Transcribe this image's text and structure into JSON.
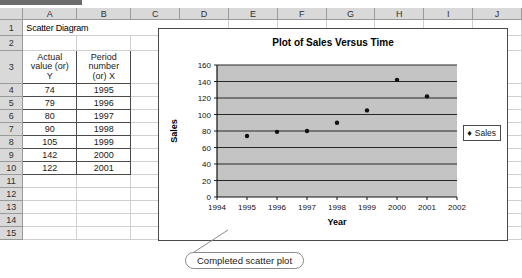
{
  "spreadsheet": {
    "column_headers": [
      "A",
      "B",
      "C",
      "D",
      "E",
      "F",
      "G",
      "H",
      "I",
      "J"
    ],
    "row_headers": [
      "1",
      "2",
      "3",
      "4",
      "5",
      "6",
      "7",
      "8",
      "9",
      "10",
      "11",
      "12",
      "13",
      "14",
      "15"
    ],
    "sheet_title": "Scatter Diagram",
    "table_headers": {
      "col_a": "Actual value (or) Y",
      "col_a_line1": "Actual",
      "col_a_line2": "value (or)",
      "col_a_line3": "Y",
      "col_b": "Period number (or) X",
      "col_b_line1": "Period",
      "col_b_line2": "number",
      "col_b_line3": "(or) X"
    },
    "rows": [
      {
        "row": "4",
        "a": "74",
        "b": "1995"
      },
      {
        "row": "5",
        "a": "79",
        "b": "1996"
      },
      {
        "row": "6",
        "a": "80",
        "b": "1997"
      },
      {
        "row": "7",
        "a": "90",
        "b": "1998"
      },
      {
        "row": "8",
        "a": "105",
        "b": "1999"
      },
      {
        "row": "9",
        "a": "142",
        "b": "2000"
      },
      {
        "row": "10",
        "a": "122",
        "b": "2001"
      }
    ]
  },
  "chart_data": {
    "type": "scatter",
    "title": "Plot of Sales Versus Time",
    "xlabel": "Year",
    "ylabel": "Sales",
    "xlim": [
      1994,
      2002
    ],
    "ylim": [
      0,
      160
    ],
    "xticks": [
      "1994",
      "1995",
      "1996",
      "1997",
      "1998",
      "1999",
      "2000",
      "2001",
      "2002"
    ],
    "yticks": [
      "0",
      "20",
      "40",
      "60",
      "80",
      "100",
      "120",
      "140",
      "160"
    ],
    "grid": "horizontal",
    "plot_area_color": "#c4c4c4",
    "marker_color": "#111111",
    "legend": {
      "position": "right",
      "entries": [
        "Sales"
      ],
      "marker": "♦"
    },
    "series": [
      {
        "name": "Sales",
        "x": [
          1995,
          1996,
          1997,
          1998,
          1999,
          2000,
          2001
        ],
        "values": [
          74,
          79,
          80,
          90,
          105,
          142,
          122
        ]
      }
    ]
  },
  "annotation": {
    "label": "Completed scatter plot"
  }
}
